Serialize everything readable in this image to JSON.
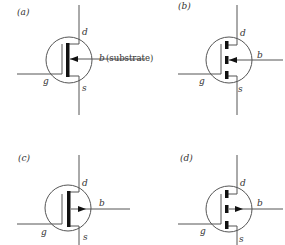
{
  "figure": {
    "panels": [
      {
        "id": "a",
        "label": "(a)",
        "drain_label": "d",
        "gate_label": "g",
        "source_label": "s",
        "body_label": "b",
        "body_note": "(substrate)",
        "channel": "continuous",
        "arrow": "inward"
      },
      {
        "id": "b",
        "label": "(b)",
        "drain_label": "d",
        "gate_label": "g",
        "source_label": "s",
        "body_label": "b",
        "channel": "segmented",
        "arrow": "inward"
      },
      {
        "id": "c",
        "label": "(c)",
        "drain_label": "d",
        "gate_label": "g",
        "source_label": "s",
        "body_label": "b",
        "channel": "continuous",
        "arrow": "outward"
      },
      {
        "id": "d",
        "label": "(d)",
        "drain_label": "d",
        "gate_label": "g",
        "source_label": "s",
        "body_label": "b",
        "channel": "segmented",
        "arrow": "outward"
      }
    ],
    "line_color": "#555555",
    "bar_color": "#111111"
  }
}
